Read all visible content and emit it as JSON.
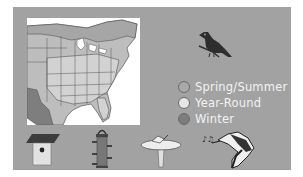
{
  "panel": {
    "background": "#a2a2a2"
  },
  "map": {
    "title": "Eastern US range map",
    "colors": {
      "spring_summer": "#a8a8a8",
      "year_round": "#d4d4d4",
      "winter": "#7a7a7a"
    }
  },
  "bird": {
    "name": "bird-silhouette"
  },
  "legend": {
    "items": [
      {
        "label": "Spring/Summer",
        "color": "#a9a9a9"
      },
      {
        "label": "Year-Round",
        "color": "#e6e6e6"
      },
      {
        "label": "Winter",
        "color": "#7c7c7c"
      }
    ]
  },
  "icons": [
    {
      "name": "birdhouse"
    },
    {
      "name": "feeder"
    },
    {
      "name": "birdbath"
    },
    {
      "name": "song"
    }
  ]
}
